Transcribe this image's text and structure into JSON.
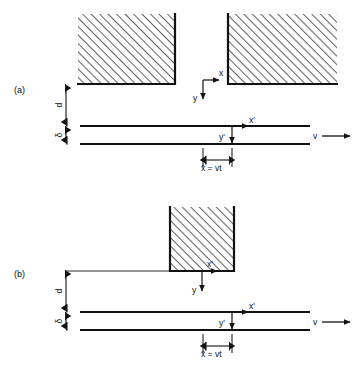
{
  "figure": {
    "type": "technical-diagram",
    "width": 362,
    "height": 365,
    "background_color": "#ffffff",
    "line_color": "#111111",
    "hatch_color": "#333333"
  },
  "panels": [
    {
      "id": "a",
      "tag": "(a)",
      "blocks": [
        {
          "name": "left-block",
          "x": 78,
          "y": 14,
          "w": 97,
          "h": 70,
          "hatch": "diagonal-45-up",
          "thick_edges": [
            "right",
            "bottom"
          ]
        },
        {
          "name": "right-block",
          "x": 228,
          "y": 14,
          "w": 109,
          "h": 70,
          "hatch": "diagonal-45-up",
          "thick_edges": [
            "left",
            "bottom"
          ]
        }
      ],
      "axes_fixed": {
        "x_label": "x",
        "y_label": "y",
        "origin_x": 203,
        "origin_y": 80,
        "x_dir": "right",
        "y_dir": "down"
      },
      "axes_moving": {
        "x_label": "x'",
        "y_label": "y'",
        "origin_x": 232,
        "origin_y": 126,
        "x_dir": "right",
        "y_dir": "down"
      },
      "dimensions": [
        {
          "name": "gap-d",
          "label": "d",
          "from_y": 84,
          "to_y": 126,
          "at_x": 66,
          "orientation": "vertical"
        },
        {
          "name": "plate-thickness-delta",
          "label": "δ",
          "from_y": 126,
          "to_y": 144,
          "at_x": 66,
          "orientation": "vertical"
        },
        {
          "name": "displacement",
          "label": "x̄ = vt",
          "from_x": 203,
          "to_x": 232,
          "at_y": 160,
          "orientation": "horizontal"
        }
      ],
      "velocity": {
        "label": "v",
        "arrow_dir": "right",
        "x": 318,
        "y": 137
      },
      "plate": {
        "top_y": 126,
        "bottom_y": 144,
        "left_x": 80,
        "right_x": 310
      }
    },
    {
      "id": "b",
      "tag": "(b)",
      "blocks": [
        {
          "name": "center-block",
          "x": 170,
          "y": 207,
          "w": 64,
          "h": 64,
          "hatch": "diagonal-45-up",
          "thick_edges": [
            "left",
            "right",
            "bottom"
          ]
        }
      ],
      "leader_line": {
        "name": "block-extension-line",
        "from_x": 66,
        "to_x": 170,
        "at_y": 271
      },
      "axes_fixed": {
        "x_label": "x",
        "y_label": "y",
        "origin_x": 202,
        "origin_y": 271,
        "x_dir": "right",
        "y_dir": "down"
      },
      "axes_moving": {
        "x_label": "x'",
        "y_label": "y'",
        "origin_x": 232,
        "origin_y": 312,
        "x_dir": "right",
        "y_dir": "down"
      },
      "dimensions": [
        {
          "name": "gap-d",
          "label": "d",
          "from_y": 271,
          "to_y": 312,
          "at_x": 66,
          "orientation": "vertical"
        },
        {
          "name": "plate-thickness-delta",
          "label": "δ",
          "from_y": 312,
          "to_y": 330,
          "at_x": 66,
          "orientation": "vertical"
        },
        {
          "name": "displacement",
          "label": "x̄ = vt",
          "from_x": 203,
          "to_x": 232,
          "at_y": 346,
          "orientation": "horizontal"
        }
      ],
      "velocity": {
        "label": "v",
        "arrow_dir": "right",
        "x": 318,
        "y": 323
      },
      "plate": {
        "top_y": 312,
        "bottom_y": 330,
        "left_x": 80,
        "right_x": 310
      }
    }
  ],
  "labels": {
    "panel_a_tag": "(a)",
    "panel_b_tag": "(b)",
    "d": "d",
    "delta": "δ",
    "x": "x",
    "y": "y",
    "x_prime": "x'",
    "y_prime": "y'",
    "v": "v",
    "xbar_eq_vt": "x̄ = vt"
  }
}
